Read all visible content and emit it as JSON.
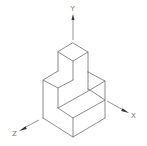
{
  "diagram": {
    "type": "isometric-drawing",
    "axes": {
      "y_label": "Y",
      "x_label": "X",
      "z_label": "Z"
    },
    "colors": {
      "line": "#6e6e6e",
      "arrow": "#333333",
      "background": "#ffffff"
    }
  }
}
